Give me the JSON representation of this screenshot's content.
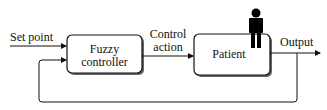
{
  "diagram": {
    "input_label": "Set point",
    "controller": {
      "line1": "Fuzzy",
      "line2": "controller"
    },
    "control_label": {
      "line1": "Control",
      "line2": "action"
    },
    "plant": {
      "label": "Patient",
      "icon": "person-icon"
    },
    "output_label": "Output",
    "colors": {
      "stroke": "#111111",
      "shadow": "#555555"
    }
  }
}
